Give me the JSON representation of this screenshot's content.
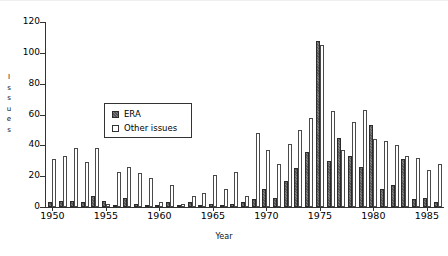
{
  "chart_data": {
    "type": "bar",
    "title": "",
    "xlabel": "Year",
    "ylabel": "Issues",
    "ylim": [
      0,
      120
    ],
    "ytick_values": [
      0,
      20,
      40,
      60,
      80,
      100,
      120
    ],
    "ytick_labels": [
      "0",
      "20",
      "40",
      "60",
      "80",
      "100",
      "120"
    ],
    "xlim": [
      1949.4,
      1986.6
    ],
    "xtick_values": [
      1950,
      1955,
      1960,
      1965,
      1970,
      1975,
      1980,
      1985
    ],
    "xtick_labels": [
      "1950",
      "1955",
      "1960",
      "1965",
      "1970",
      "1975",
      "1980",
      "1985"
    ],
    "grid": false,
    "legend_position": "upper-left-center",
    "categories": [
      1950,
      1951,
      1952,
      1953,
      1954,
      1955,
      1956,
      1957,
      1958,
      1959,
      1960,
      1961,
      1962,
      1963,
      1964,
      1965,
      1966,
      1967,
      1968,
      1969,
      1970,
      1971,
      1972,
      1973,
      1974,
      1975,
      1976,
      1977,
      1978,
      1979,
      1980,
      1981,
      1982,
      1983,
      1984,
      1985,
      1986
    ],
    "series": [
      {
        "name": "ERA",
        "color": "#6e6e6e",
        "values": [
          3,
          4,
          4,
          3,
          7,
          4,
          1,
          6,
          2,
          1,
          1,
          3,
          1,
          3,
          1,
          2,
          1,
          2,
          3,
          5,
          12,
          6,
          17,
          25,
          36,
          108,
          30,
          45,
          33,
          26,
          53,
          12,
          14,
          31,
          5,
          6,
          3
        ]
      },
      {
        "name": "Other issues",
        "color": "#ffffff",
        "values": [
          31,
          33,
          38,
          29,
          38,
          2,
          23,
          26,
          22,
          19,
          3,
          14,
          2,
          7,
          9,
          21,
          12,
          23,
          7,
          48,
          37,
          28,
          41,
          50,
          58,
          105,
          62,
          37,
          55,
          63,
          44,
          43,
          40,
          33,
          32,
          24,
          28
        ]
      }
    ]
  },
  "legend": {
    "entries": [
      {
        "label": "ERA",
        "swatch": "era"
      },
      {
        "label": "Other issues",
        "swatch": "other"
      }
    ]
  }
}
